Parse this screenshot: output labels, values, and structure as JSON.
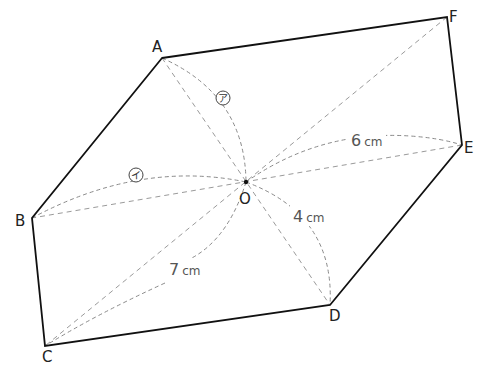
{
  "figure": {
    "type": "hexagon-with-center-diagonals",
    "vertices": [
      {
        "name": "A",
        "x": 162,
        "y": 58,
        "label_dx": -6,
        "label_dy": -6
      },
      {
        "name": "F",
        "x": 447,
        "y": 17,
        "label_dx": 4,
        "label_dy": 6
      },
      {
        "name": "E",
        "x": 462,
        "y": 145,
        "label_dx": 4,
        "label_dy": 8
      },
      {
        "name": "D",
        "x": 330,
        "y": 305,
        "label_dx": 0,
        "label_dy": 20
      },
      {
        "name": "C",
        "x": 45,
        "y": 346,
        "label_dx": -2,
        "label_dy": 20
      },
      {
        "name": "B",
        "x": 32,
        "y": 218,
        "label_dx": -18,
        "label_dy": 8
      }
    ],
    "center": {
      "name": "O",
      "x": 246,
      "y": 182
    },
    "labels": {
      "A": "A",
      "B": "B",
      "C": "C",
      "D": "D",
      "E": "E",
      "F": "F",
      "O": "O"
    },
    "measurements": [
      {
        "id": "oe",
        "num": "6",
        "unit": "cm",
        "x": 351,
        "y": 145
      },
      {
        "id": "od",
        "num": "4",
        "unit": "cm",
        "x": 293,
        "y": 224
      },
      {
        "id": "oc",
        "num": "7",
        "unit": "cm",
        "x": 170,
        "y": 275
      }
    ],
    "angle_marks": [
      {
        "id": "a",
        "glyph": "ア",
        "x": 223,
        "y": 98
      },
      {
        "id": "i",
        "glyph": "イ",
        "x": 136,
        "y": 175
      }
    ],
    "colors": {
      "edge": "#111111",
      "diagonal": "#9a9a9a",
      "arc": "#8a8a8a",
      "text": "#222222"
    }
  }
}
